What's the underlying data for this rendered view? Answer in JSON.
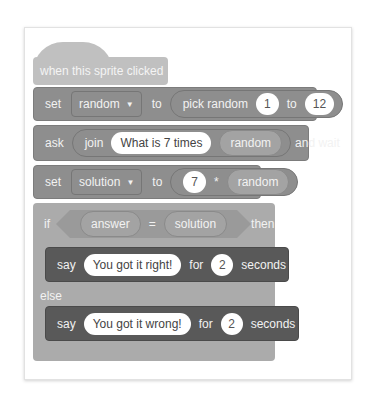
{
  "script": {
    "hat": {
      "label": "when this sprite clicked"
    },
    "set_random": {
      "set": "set",
      "variable": "random",
      "to": "to",
      "reporter": {
        "label": "pick random",
        "from": "1",
        "to_label": "to",
        "to": "12"
      }
    },
    "ask": {
      "ask": "ask",
      "join": "join",
      "text": "What is 7 times",
      "var": "random",
      "and_wait": "and wait"
    },
    "set_solution": {
      "set": "set",
      "variable": "solution",
      "to": "to",
      "left": "7",
      "op": "*",
      "right": "random"
    },
    "if_else": {
      "if": "if",
      "left": "answer",
      "op": "=",
      "right": "solution",
      "then": "then",
      "else": "else"
    },
    "say_right": {
      "say": "say",
      "message": "You got it right!",
      "for": "for",
      "secs": "2",
      "seconds": "seconds"
    },
    "say_wrong": {
      "say": "say",
      "message": "You got it wrong!",
      "for": "for",
      "secs": "2",
      "seconds": "seconds"
    },
    "dropdown_arrow": "▼"
  },
  "colors": {
    "hat": "#c0c0c0",
    "variables": "#8e8e8e",
    "control": "#ababab",
    "looks": "#595959"
  }
}
